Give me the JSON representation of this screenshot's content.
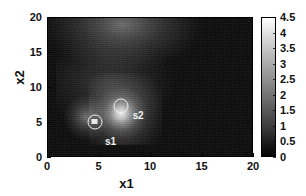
{
  "chart_data": {
    "type": "heatmap",
    "title": "",
    "xlabel": "x1",
    "ylabel": "x2",
    "xlim": [
      0,
      20
    ],
    "ylim": [
      0,
      20
    ],
    "xticks": [
      "0",
      "5",
      "10",
      "15",
      "20"
    ],
    "yticks": [
      "0",
      "5",
      "10",
      "15",
      "20"
    ],
    "xtick_values": [
      0,
      5,
      10,
      15,
      20
    ],
    "ytick_values": [
      0,
      5,
      10,
      15,
      20
    ],
    "grid": false,
    "colormap": "gray",
    "colorbar": {
      "min": 0,
      "max": 4.5,
      "position": "right",
      "ticks": [
        "4.5",
        "4",
        "3.5",
        "3",
        "2.5",
        "2",
        "1.5",
        "1",
        "0.5",
        "0"
      ],
      "tick_values": [
        4.5,
        4,
        3.5,
        3,
        2.5,
        2,
        1.5,
        1,
        0.5,
        0
      ],
      "top_color": "#ffffff",
      "bottom_color": "#000000"
    },
    "background_level": 0.15,
    "annotations": [
      {
        "name": "s1",
        "label": "s1",
        "marker": "circle-with-square",
        "x": 4.6,
        "y": 5.0,
        "label_x": 5.6,
        "label_y": 2.9,
        "color": "#f2f2f2",
        "peak_value": 1.6
      },
      {
        "name": "s2",
        "label": "s2",
        "marker": "circle",
        "x": 7.2,
        "y": 7.2,
        "label_x": 8.3,
        "label_y": 6.6,
        "color": "#f2f2f2",
        "peak_value": 4.5
      }
    ],
    "hotspots": [
      {
        "name": "source-s2-peak",
        "x": 6.6,
        "y": 7.4,
        "value": 4.5,
        "radius": 2.2
      },
      {
        "name": "source-s1-peak",
        "x": 4.6,
        "y": 5.0,
        "value": 1.8,
        "radius": 1.4
      },
      {
        "name": "diffuse-lobe",
        "x": 7.5,
        "y": 14.0,
        "value": 1.9,
        "radius": 5.5
      }
    ]
  }
}
